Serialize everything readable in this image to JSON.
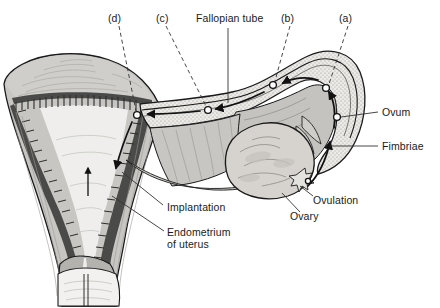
{
  "figure": {
    "background_color": "#ffffff",
    "ink_color": "#1a1a1a",
    "width": 440,
    "height": 308
  },
  "palette": {
    "myometrium": "#c7c6c2",
    "uterine_wall_dark": "#b3b2ae",
    "ovary": "#d6d3ce",
    "tube_wall": "#c4c3bf",
    "tube_lumen": "#efeeec",
    "endometrium_dark": "#4a4a48",
    "cervix_light": "#f2f1ef",
    "outline": "#1a1a1a"
  },
  "labels": {
    "stage_d": "(d)",
    "stage_c": "(c)",
    "stage_b": "(b)",
    "stage_a": "(a)",
    "fallopian_tube": "Fallopian tube",
    "ovum": "Ovum",
    "fimbriae": "Fimbriae",
    "ovulation": "Ovulation",
    "ovary": "Ovary",
    "implantation": "Implantation",
    "endometrium_line1": "Endometrium",
    "endometrium_line2": "of uterus"
  },
  "stages": [
    {
      "key": "a",
      "label": "(a)",
      "meaning": "ovum swept into infundibulum by fimbriae",
      "marker_x": 326,
      "marker_y": 88
    },
    {
      "key": "b",
      "label": "(b)",
      "meaning": "ovum in ampulla of fallopian tube",
      "marker_x": 273,
      "marker_y": 85
    },
    {
      "key": "c",
      "label": "(c)",
      "meaning": "dividing zygote travelling down the tube",
      "marker_x": 208,
      "marker_y": 110
    },
    {
      "key": "d",
      "label": "(d)",
      "meaning": "blastocyst implanting in endometrium",
      "marker_x": 137,
      "marker_y": 115
    }
  ],
  "structures": [
    {
      "name": "uterus",
      "note": "sectioned body of uterus with triangular cavity"
    },
    {
      "name": "endometrium",
      "note": "shaggy dark lining of the uterine cavity"
    },
    {
      "name": "myometrium",
      "note": "grey muscular wall with fibre striations"
    },
    {
      "name": "cervix",
      "note": "narrow canal at lower end of uterus"
    },
    {
      "name": "fallopian-tube",
      "note": "tube running from uterus to ovary, stippled wall"
    },
    {
      "name": "infundibulum",
      "note": "funnel-shaped end of the tube"
    },
    {
      "name": "fimbriae",
      "note": "finger-like projections around ovary"
    },
    {
      "name": "ovary",
      "note": "lobulated ovoid body below the tube"
    },
    {
      "name": "ovulation-site",
      "note": "ruptured follicle releasing the ovum"
    }
  ],
  "annotations": {
    "flow_direction": "ovum travels from ovary (a) through tube (b, c) to implantation site (d)",
    "arrow_count": 6,
    "leader_styles": {
      "stages": "dashed",
      "structures": "solid"
    }
  }
}
